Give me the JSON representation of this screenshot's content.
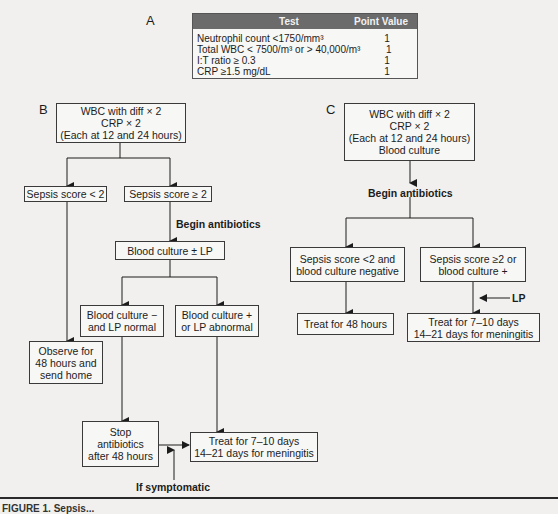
{
  "panelA": {
    "letter": "A",
    "table": {
      "headers": [
        "Test",
        "Point Value"
      ],
      "rows": [
        {
          "test": "Neutrophil count <1750/mm³",
          "points": "1"
        },
        {
          "test": "Total WBC < 7500/m³ or > 40,000/m³",
          "points": "1"
        },
        {
          "test": "I:T ratio ≥ 0.3",
          "points": "1"
        },
        {
          "test": "CRP ≥1.5 mg/dL",
          "points": "1"
        }
      ]
    }
  },
  "panelB": {
    "letter": "B",
    "start": [
      "WBC with diff × 2",
      "CRP × 2",
      "(Each at 12 and 24 hours)"
    ],
    "score_low": "Sepsis score < 2",
    "score_high": "Sepsis score ≥ 2",
    "begin_antibiotics": "Begin antibiotics",
    "culture_lp": "Blood culture ± LP",
    "culture_neg": [
      "Blood culture −",
      "and LP normal"
    ],
    "culture_pos": [
      "Blood culture +",
      "or LP abnormal"
    ],
    "observe": [
      "Observe for",
      "48 hours and",
      "send home"
    ],
    "stop": [
      "Stop",
      "antibiotics",
      "after 48 hours"
    ],
    "treat": [
      "Treat for 7–10 days",
      "14–21 days for meningitis"
    ],
    "if_symptomatic": "If symptomatic"
  },
  "panelC": {
    "letter": "C",
    "start": [
      "WBC with diff × 2",
      "CRP × 2",
      "(Each at 12 and 24 hours)",
      "Blood culture"
    ],
    "begin_antibiotics": "Begin antibiotics",
    "neg": [
      "Sepsis score <2 and",
      "blood culture negative"
    ],
    "pos": [
      "Sepsis score ≥2 or",
      "blood culture +"
    ],
    "lp": "LP",
    "treat48": "Treat for 48 hours",
    "treat": [
      "Treat for 7–10 days",
      "14–21 days for meningitis"
    ]
  },
  "footer": {
    "caption": "FIGURE 1. Sepsis..."
  }
}
